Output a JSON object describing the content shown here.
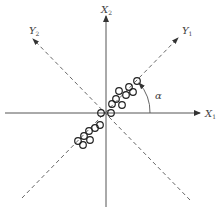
{
  "diagram": {
    "axes": {
      "x1": {
        "label": "X",
        "subscript": "1"
      },
      "x2": {
        "label": "X",
        "subscript": "2"
      },
      "y1": {
        "label": "Y",
        "subscript": "1"
      },
      "y2": {
        "label": "Y",
        "subscript": "2"
      }
    },
    "angle": {
      "label": "α"
    },
    "colors": {
      "line": "#555555",
      "points": "#222222"
    },
    "points": [
      [
        78,
        141
      ],
      [
        84,
        136
      ],
      [
        89,
        131
      ],
      [
        83,
        145
      ],
      [
        90,
        141
      ],
      [
        95,
        129
      ],
      [
        101,
        126
      ],
      [
        98,
        119
      ],
      [
        101,
        113
      ],
      [
        111,
        113
      ],
      [
        111,
        104
      ],
      [
        117,
        99
      ],
      [
        122,
        106
      ],
      [
        118,
        91
      ],
      [
        125,
        94
      ],
      [
        130,
        86
      ],
      [
        133,
        92
      ],
      [
        138,
        80
      ]
    ]
  }
}
